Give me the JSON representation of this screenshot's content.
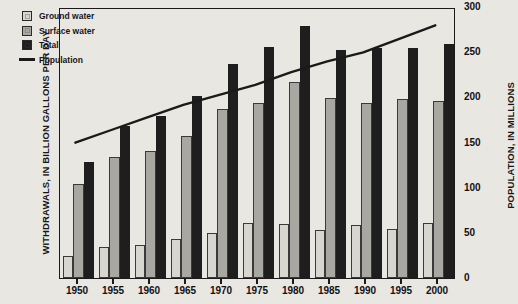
{
  "chart_data": {
    "type": "bar",
    "title": "",
    "categories": [
      "1950",
      "1955",
      "1960",
      "1965",
      "1970",
      "1975",
      "1980",
      "1985",
      "1990",
      "1995",
      "2000"
    ],
    "series": [
      {
        "name": "Ground water",
        "values": [
          32,
          46,
          49,
          58,
          66,
          81,
          80,
          71,
          78,
          73,
          81
        ],
        "color": "#d8d6d1",
        "axis": "left"
      },
      {
        "name": "Surface water",
        "values": [
          139,
          178,
          188,
          209,
          249,
          259,
          290,
          265,
          259,
          264,
          262
        ],
        "color": "#a9a7a2",
        "axis": "left"
      },
      {
        "name": "Total",
        "values": [
          171,
          225,
          239,
          268,
          316,
          341,
          372,
          337,
          339,
          340,
          345
        ],
        "color": "#1e1e1e",
        "axis": "left"
      }
    ],
    "line_series": {
      "name": "Population",
      "values": [
        152,
        166,
        180,
        194,
        205,
        216,
        230,
        242,
        252,
        267,
        282
      ],
      "color": "#1a1a1a",
      "axis": "right"
    },
    "xlabel": "",
    "ylabel": "WITHDRAWALS, IN BILLION GALLONS PER DAY",
    "ylabel_right": "POPULATION, IN MILLIONS",
    "ylim": [
      0,
      400
    ],
    "yticks": [
      "0",
      "50",
      "100",
      "150",
      "200",
      "250",
      "300",
      "350",
      "400"
    ],
    "ylim_right": [
      0,
      300
    ],
    "yticks_right": [
      "0",
      "50",
      "100",
      "150",
      "200",
      "250",
      "300"
    ],
    "grid": false,
    "legend_position": "top-left",
    "legend": [
      "Ground water",
      "Surface water",
      "Total",
      "Population"
    ]
  }
}
